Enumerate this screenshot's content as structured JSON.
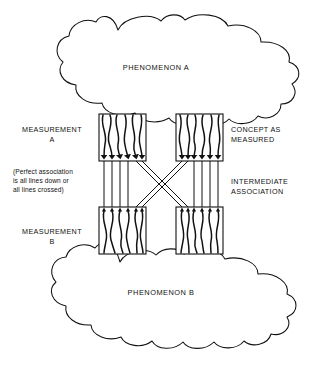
{
  "figure": {
    "kind": "conceptual-diagram",
    "background_color": "#ffffff",
    "ink_color": "#111111",
    "width": 321,
    "height": 366
  },
  "clouds": {
    "top": {
      "label": "PHENOMENON A",
      "center_x": 156,
      "center_y": 68
    },
    "bottom": {
      "label": "PHENOMENON B",
      "center_x": 161,
      "center_y": 293
    }
  },
  "labels": {
    "measurement_a": "MEASUREMENT\nA",
    "measurement_b": "MEASUREMENT\nB",
    "concept_as_measured": "CONCEPT AS\nMEASURED",
    "intermediate_association": "INTERMEDIATE\nASSOCIATION",
    "note": "(Perfect association\nis all lines down or\nall lines crossed)"
  },
  "boxes": [
    {
      "name": "measurement-a-box",
      "x": 99,
      "y": 114,
      "w": 47,
      "h": 47,
      "strand_count": 6,
      "arrow_edge": "bottom"
    },
    {
      "name": "concept-as-measured-box",
      "x": 176,
      "y": 114,
      "w": 47,
      "h": 47,
      "strand_count": 6,
      "arrow_edge": "bottom"
    },
    {
      "name": "measurement-b-box",
      "x": 99,
      "y": 207,
      "w": 47,
      "h": 47,
      "strand_count": 6,
      "arrow_edge": "top"
    },
    {
      "name": "intermediate-association-box",
      "x": 176,
      "y": 207,
      "w": 47,
      "h": 47,
      "strand_count": 6,
      "arrow_edge": "top"
    }
  ],
  "crossing": {
    "name": "x-crossing-bundle",
    "straight_lines_per_side": 4,
    "crossed_lines_per_side": 2,
    "top_y": 161,
    "bottom_y": 207
  }
}
